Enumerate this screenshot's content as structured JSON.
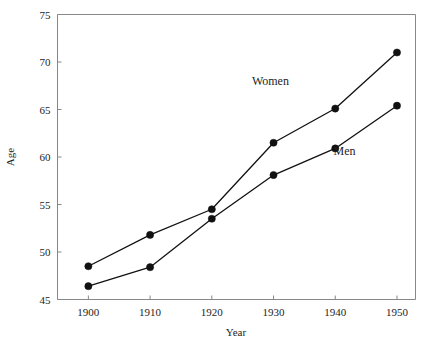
{
  "chart_data": {
    "type": "line",
    "title": "",
    "xlabel": "Year",
    "ylabel": "Age",
    "x": [
      1900,
      1910,
      1920,
      1930,
      1940,
      1950
    ],
    "xtick_labels": [
      "1900",
      "1910",
      "1920",
      "1930",
      "1940",
      "1950"
    ],
    "ytick_labels": [
      "45",
      "50",
      "55",
      "60",
      "65",
      "70",
      "75"
    ],
    "yticks": [
      45,
      50,
      55,
      60,
      65,
      70,
      75
    ],
    "xlim": [
      1895,
      1953
    ],
    "ylim": [
      45,
      75
    ],
    "grid": false,
    "legend_position": "inline-annotation",
    "series": [
      {
        "name": "Women",
        "label": "Women",
        "values": [
          48.5,
          51.8,
          54.5,
          61.5,
          65.1,
          71.0
        ],
        "color": "#111111"
      },
      {
        "name": "Men",
        "label": "Men",
        "values": [
          46.4,
          48.4,
          53.5,
          58.1,
          60.9,
          65.4
        ],
        "color": "#111111"
      }
    ],
    "annotations": [
      {
        "text": "Women",
        "x": 1929.5,
        "y": 67.6
      },
      {
        "text": "Men",
        "x": 1941.5,
        "y": 60.2
      }
    ]
  },
  "axes": {
    "x_axis_title": "Year",
    "y_axis_title": "Age"
  }
}
